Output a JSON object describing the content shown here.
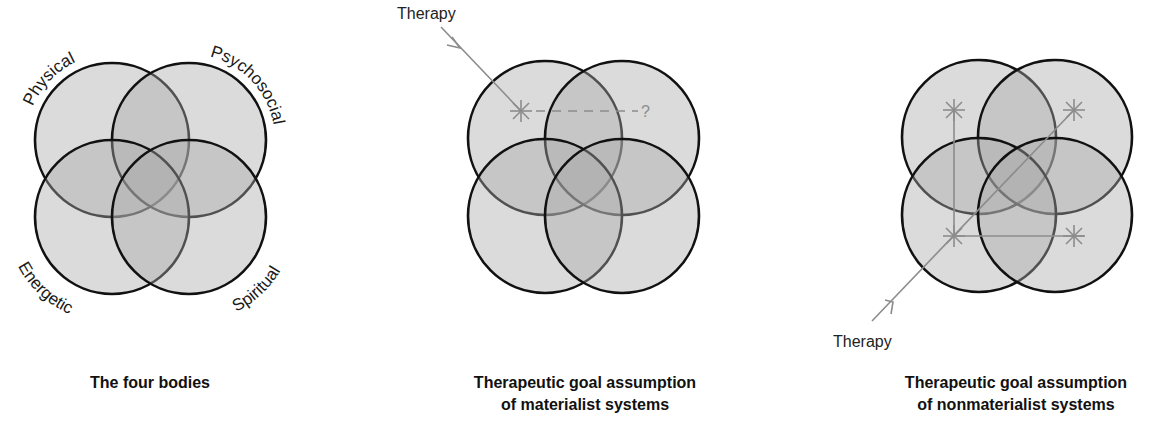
{
  "panels": [
    {
      "id": "four-bodies",
      "caption_line1": "The four bodies",
      "caption_line2": "",
      "labels": {
        "top_left": "Physical",
        "top_right": "Psychosocial",
        "bottom_left": "Energetic",
        "bottom_right": "Spiritual"
      }
    },
    {
      "id": "materialist",
      "caption_line1": "Therapeutic goal assumption",
      "caption_line2": "of materialist systems",
      "therapy_label": "Therapy",
      "unknown_mark": "?"
    },
    {
      "id": "nonmaterialist",
      "caption_line1": "Therapeutic goal assumption",
      "caption_line2": "of nonmaterialist systems",
      "therapy_label": "Therapy"
    }
  ],
  "colors": {
    "outline": "#111111",
    "fill": "#dcdcdc",
    "overlap2": "#b4b4b4",
    "overlap4": "#8a8a8a",
    "therapy_marker": "#8c8c8c"
  }
}
